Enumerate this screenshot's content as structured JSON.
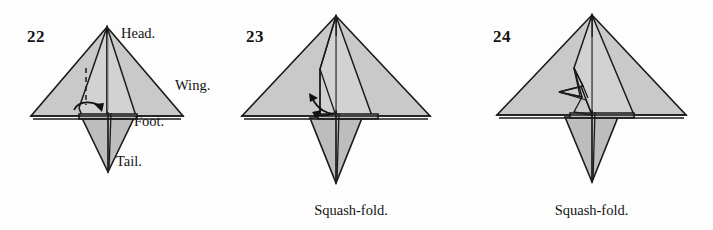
{
  "document": {
    "kind": "origami-instruction-diagram",
    "background_color": "#fdfdfd",
    "paper_fill_color": "#c9c9c9",
    "line_color": "#1b1b1b",
    "crease_color": "#8c8c8c"
  },
  "panels": [
    {
      "step_number": "22",
      "caption": "",
      "labels": {
        "head": "Head.",
        "wing": "Wing.",
        "foot": "Foot.",
        "tail": "Tail."
      },
      "annotations": {
        "fold_marker": "valley-fold-dashed-line",
        "arrow": "curved-fold-arrow-right"
      }
    },
    {
      "step_number": "23",
      "caption": "Squash-fold.",
      "annotations": {
        "arrow": "double-headed-squash-fold-arrow"
      }
    },
    {
      "step_number": "24",
      "caption": "Squash-fold.",
      "annotations": {
        "arrow": "none"
      }
    }
  ]
}
